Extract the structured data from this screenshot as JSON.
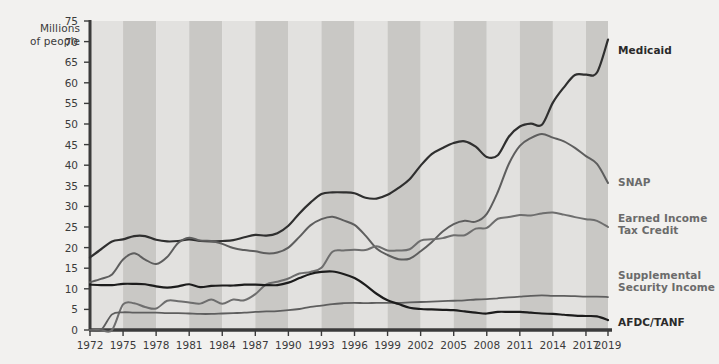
{
  "chart_data": {
    "type": "line",
    "title": "",
    "subtitle": "",
    "ylabel": "Millions of people",
    "ylabel_line1": "Millions",
    "ylabel_line2": "of people",
    "xlabel": "",
    "ylim": [
      0,
      75
    ],
    "xlim": [
      1972,
      2019
    ],
    "ytick_step": 5,
    "yticks": [
      0,
      5,
      10,
      15,
      20,
      25,
      30,
      35,
      40,
      45,
      50,
      55,
      60,
      65,
      70,
      75
    ],
    "xticks": [
      1972,
      1975,
      1978,
      1981,
      1984,
      1987,
      1990,
      1993,
      1996,
      1999,
      2002,
      2005,
      2008,
      2011,
      2014,
      2017,
      2019
    ],
    "grid": false,
    "banding": "alternating vertical gray bands every 3 years",
    "legend_position": "right-of-plot, at end of each line",
    "x": [
      1972,
      1973,
      1974,
      1975,
      1976,
      1977,
      1978,
      1979,
      1980,
      1981,
      1982,
      1983,
      1984,
      1985,
      1986,
      1987,
      1988,
      1989,
      1990,
      1991,
      1992,
      1993,
      1994,
      1995,
      1996,
      1997,
      1998,
      1999,
      2000,
      2001,
      2002,
      2003,
      2004,
      2005,
      2006,
      2007,
      2008,
      2009,
      2010,
      2011,
      2012,
      2013,
      2014,
      2015,
      2016,
      2017,
      2018,
      2019
    ],
    "series": [
      {
        "name": "Medicaid",
        "label": "Medicaid",
        "color": "#2f2f2f",
        "width": 2.2,
        "values": [
          17.6,
          19.6,
          21.5,
          22.0,
          22.8,
          22.8,
          21.9,
          21.5,
          21.6,
          22.0,
          21.6,
          21.5,
          21.6,
          21.8,
          22.5,
          23.1,
          22.9,
          23.5,
          25.3,
          28.3,
          30.9,
          33.0,
          33.4,
          33.4,
          33.2,
          32.1,
          31.9,
          32.8,
          34.5,
          36.6,
          39.9,
          42.7,
          44.2,
          45.4,
          45.8,
          44.5,
          42.0,
          42.4,
          46.9,
          49.4,
          50.1,
          49.8,
          55.2,
          58.9,
          61.9,
          62.0,
          62.5,
          70.5
        ]
      },
      {
        "name": "SNAP",
        "label": "SNAP",
        "color": "#5e5e5e",
        "width": 2.0,
        "values": [
          11.6,
          12.4,
          13.5,
          17.1,
          18.6,
          17.1,
          16.0,
          17.7,
          21.1,
          22.4,
          21.7,
          21.6,
          20.9,
          19.9,
          19.4,
          19.1,
          18.6,
          18.8,
          20.0,
          22.6,
          25.4,
          26.9,
          27.5,
          26.6,
          25.5,
          22.9,
          19.8,
          18.2,
          17.2,
          17.3,
          19.1,
          21.3,
          23.9,
          25.7,
          26.5,
          26.3,
          28.2,
          33.5,
          40.3,
          44.7,
          46.6,
          47.6,
          46.7,
          45.8,
          44.2,
          42.2,
          40.3,
          35.7
        ]
      },
      {
        "name": "Earned Income\nTax Credit",
        "label": "Earned Income Tax Credit",
        "color": "#6e6e6e",
        "width": 2.0,
        "values": [
          0,
          0,
          0,
          6.2,
          6.5,
          5.6,
          5.2,
          7.1,
          7.0,
          6.7,
          6.4,
          7.4,
          6.4,
          7.4,
          7.2,
          8.7,
          11.1,
          11.7,
          12.5,
          13.7,
          14.1,
          15.1,
          19.0,
          19.3,
          19.5,
          19.4,
          20.3,
          19.3,
          19.3,
          19.6,
          21.7,
          22.0,
          22.3,
          23.0,
          23.0,
          24.6,
          24.8,
          27.0,
          27.4,
          27.9,
          27.8,
          28.3,
          28.5,
          28.0,
          27.4,
          26.9,
          26.5,
          25.0
        ]
      },
      {
        "name": "Supplemental\nSecurity Income",
        "label": "Supplemental Security Income",
        "color": "#5e5e5e",
        "width": 1.8,
        "values": [
          0,
          0,
          3.8,
          4.3,
          4.2,
          4.2,
          4.2,
          4.1,
          4.1,
          4.0,
          3.9,
          3.9,
          4.0,
          4.1,
          4.2,
          4.4,
          4.5,
          4.6,
          4.8,
          5.1,
          5.6,
          5.9,
          6.3,
          6.5,
          6.6,
          6.5,
          6.6,
          6.6,
          6.6,
          6.7,
          6.8,
          6.9,
          7.0,
          7.1,
          7.2,
          7.4,
          7.5,
          7.7,
          7.9,
          8.1,
          8.3,
          8.4,
          8.3,
          8.3,
          8.2,
          8.1,
          8.1,
          8.0
        ]
      },
      {
        "name": "AFDC/TANF",
        "label": "AFDC/TANF",
        "color": "#1c1c1c",
        "width": 2.2,
        "values": [
          11.0,
          10.9,
          10.9,
          11.2,
          11.2,
          11.1,
          10.6,
          10.3,
          10.6,
          11.1,
          10.4,
          10.7,
          10.8,
          10.8,
          11.0,
          11.0,
          10.9,
          10.9,
          11.5,
          12.6,
          13.6,
          14.1,
          14.2,
          13.6,
          12.6,
          10.9,
          8.8,
          7.2,
          6.3,
          5.4,
          5.1,
          5.0,
          4.9,
          4.8,
          4.5,
          4.2,
          4.0,
          4.4,
          4.4,
          4.4,
          4.2,
          4.0,
          3.9,
          3.7,
          3.5,
          3.4,
          3.3,
          2.4
        ]
      }
    ]
  },
  "legend": [
    {
      "id": "medicaid",
      "text": "Medicaid",
      "x": 618,
      "y": 44,
      "dark": true
    },
    {
      "id": "snap",
      "text": "SNAP",
      "x": 618,
      "y": 176,
      "dark": false
    },
    {
      "id": "eitc",
      "text": "Earned Income\nTax Credit",
      "x": 618,
      "y": 212,
      "dark": false
    },
    {
      "id": "ssi",
      "text": "Supplemental\nSecurity Income",
      "x": 618,
      "y": 269,
      "dark": false
    },
    {
      "id": "afdc",
      "text": "AFDC/TANF",
      "x": 618,
      "y": 316,
      "dark": true
    }
  ],
  "colors": {
    "page_background": "#f2f1ef",
    "band_light": "#e2e1df",
    "band_dark": "#c9c8c5",
    "axis": "#3b3b3b",
    "tick_text": "#3b3b3b",
    "legend_text": "#6b6b6b",
    "legend_text_dark": "#2a2a2a"
  }
}
